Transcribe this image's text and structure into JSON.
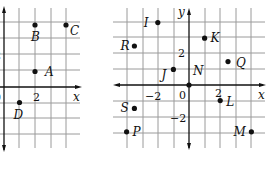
{
  "chart_data": [
    {
      "type": "scatter",
      "title": "",
      "xlabel": "x",
      "ylabel": "",
      "tick_labels": {
        "x": [
          "0",
          "2"
        ],
        "y": [
          "2"
        ]
      },
      "grid": true,
      "layout": {
        "origin_px": [
          4,
          87
        ],
        "unit_px": 15.5,
        "x_range": [
          0,
          4
        ],
        "y_range": [
          -3,
          4
        ]
      },
      "points": [
        {
          "name": "A",
          "x": 2,
          "y": 1,
          "label_dx": 10,
          "label_dy": 4
        },
        {
          "name": "B",
          "x": 2,
          "y": 4,
          "label_dx": -4,
          "label_dy": 16
        },
        {
          "name": "C",
          "x": 4,
          "y": 4,
          "label_dx": 4,
          "label_dy": 10
        },
        {
          "name": "D",
          "x": 1,
          "y": -1,
          "label_dx": -6,
          "label_dy": 16
        }
      ]
    },
    {
      "type": "scatter",
      "title": "",
      "xlabel": "x",
      "ylabel": "y",
      "tick_labels": {
        "x": [
          "-2",
          "0",
          "2"
        ],
        "y": [
          "2",
          "-2"
        ]
      },
      "grid": true,
      "layout": {
        "origin_px": [
          189,
          85
        ],
        "unit_px": 15.6,
        "x_range": [
          -4,
          4
        ],
        "y_range": [
          -3,
          4
        ]
      },
      "points": [
        {
          "name": "I",
          "x": -2,
          "y": 4,
          "label_dx": -14,
          "label_dy": 4
        },
        {
          "name": "K",
          "x": 1,
          "y": 3,
          "label_dx": 6,
          "label_dy": 4
        },
        {
          "name": "R",
          "x": -3.5,
          "y": 2.5,
          "label_dx": -14,
          "label_dy": 4
        },
        {
          "name": "Q",
          "x": 2.5,
          "y": 1.5,
          "label_dx": 8,
          "label_dy": 5
        },
        {
          "name": "J",
          "x": -1,
          "y": 1,
          "label_dx": -12,
          "label_dy": 10
        },
        {
          "name": "N",
          "x": 0,
          "y": 0,
          "label_dx": 4,
          "label_dy": -10
        },
        {
          "name": "L",
          "x": 2,
          "y": -1,
          "label_dx": 6,
          "label_dy": 5
        },
        {
          "name": "S",
          "x": -3.5,
          "y": -1.5,
          "label_dx": -14,
          "label_dy": 4
        },
        {
          "name": "P",
          "x": -4,
          "y": -3,
          "label_dx": 6,
          "label_dy": 4
        },
        {
          "name": "M",
          "x": 4,
          "y": -3,
          "label_dx": -18,
          "label_dy": 4
        }
      ]
    }
  ]
}
